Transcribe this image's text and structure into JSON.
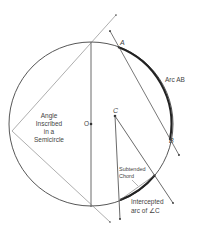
{
  "diagram": {
    "colors": {
      "stroke": "#333333",
      "thin_line": "#555555",
      "text": "#444444",
      "background": "#ffffff"
    },
    "points": {
      "A": "A",
      "B": "B",
      "C": "C",
      "O": "O"
    },
    "labels": {
      "arc_ab": "Arc AB",
      "inscribed_line1": "Angle",
      "inscribed_line2": "Inscribed",
      "inscribed_line3": "in a",
      "inscribed_line4": "Semicircle",
      "subtended_line1": "Subtended",
      "subtended_line2": "Chord",
      "intercepted_line1": "Intercepted",
      "intercepted_line2": "arc of ∠C"
    }
  }
}
